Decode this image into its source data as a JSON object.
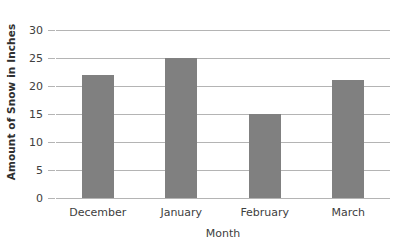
{
  "chart_data": {
    "type": "bar",
    "title": "",
    "categories": [
      "December",
      "January",
      "February",
      "March"
    ],
    "values": [
      22,
      25,
      15,
      21
    ],
    "xlabel": "Month",
    "ylabel": "Amount of Snow in Inches",
    "ylim": [
      0,
      30
    ],
    "ytick_labels": [
      "0",
      "5",
      "10",
      "15",
      "20",
      "25",
      "30"
    ],
    "ytick_values": [
      0,
      5,
      10,
      15,
      20,
      25,
      30
    ],
    "grid": true,
    "legend": false,
    "series_color": "#808080",
    "gridline_color": "#b4b4b4",
    "background_color": "#ffffff"
  }
}
